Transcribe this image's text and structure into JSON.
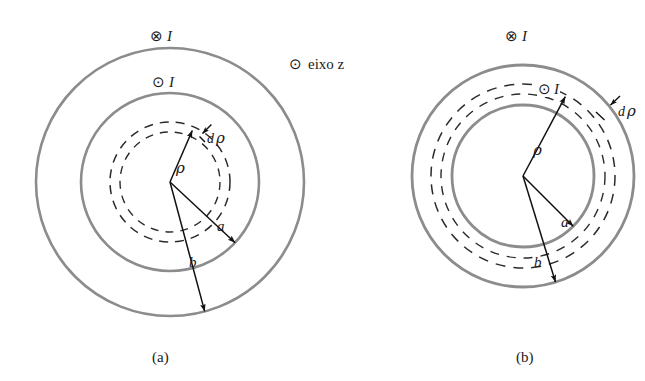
{
  "figure": {
    "title_domain": "magnetostatics-coaxial-cable-cross-section",
    "background_color": "#ffffff",
    "solid_circle_color": "#8c8c8c",
    "dashed_circle_color": "#2b2b2b",
    "arrow_color": "#111111",
    "text_color": "#1a1a1a"
  },
  "axis_key": {
    "symbol": "⊙",
    "label": "eixo z"
  },
  "panels": [
    {
      "id": "a",
      "caption": "(a)",
      "center_x": 170,
      "center_y": 182,
      "current_outer": {
        "symbol": "⊗",
        "label": "I"
      },
      "current_inner": {
        "symbol": "⊙",
        "label": "I"
      },
      "circles": {
        "outer_solid_r": 134,
        "inner_solid_r": 89,
        "dashed_outer_r": 60,
        "dashed_inner_r": 50
      },
      "arrows": [
        {
          "name": "rho",
          "label": "ρ",
          "label_x": 178,
          "label_y": 168,
          "angle_deg": -113,
          "length": 56
        },
        {
          "name": "a",
          "label": "a",
          "label_x": 218,
          "label_y": 226,
          "angle_deg": -43,
          "length": 89
        },
        {
          "name": "b",
          "label": "b",
          "label_x": 190,
          "label_y": 262,
          "angle_deg": -75,
          "length": 134
        },
        {
          "name": "drho",
          "label": "dρ",
          "label_x": 210,
          "label_y": 130,
          "angle_deg": -52,
          "length": 11
        }
      ]
    },
    {
      "id": "b",
      "caption": "(b)",
      "center_x": 523,
      "center_y": 176,
      "current_outer": {
        "symbol": "⊗",
        "label": "I"
      },
      "current_inner": {
        "symbol": "⊙",
        "label": "I"
      },
      "circles": {
        "outer_solid_r": 111,
        "inner_solid_r": 71,
        "dashed_outer_r": 92,
        "dashed_inner_r": 82
      },
      "arrows": [
        {
          "name": "rho",
          "label": "ρ",
          "label_x": 536,
          "label_y": 150,
          "angle_deg": -118,
          "length": 90
        },
        {
          "name": "a",
          "label": "a",
          "label_x": 563,
          "label_y": 222,
          "angle_deg": -45,
          "length": 71
        },
        {
          "name": "b",
          "label": "b",
          "label_x": 536,
          "label_y": 262,
          "angle_deg": -73,
          "length": 111
        },
        {
          "name": "drho",
          "label": "dρ",
          "label_x": 618,
          "label_y": 106,
          "angle_deg": -58,
          "length": 11
        }
      ]
    }
  ],
  "labels": {
    "panel_a_outer_I": "I",
    "panel_a_inner_I": "I",
    "panel_b_outer_I": "I",
    "panel_b_inner_I": "I",
    "cross_symbol": "⊗",
    "dot_symbol": "⊙",
    "rho": "ρ",
    "a": "a",
    "b": "b",
    "d_prefix": "d",
    "caption_a": "(a)",
    "caption_b": "(b)",
    "axis_text": "eixo z"
  }
}
